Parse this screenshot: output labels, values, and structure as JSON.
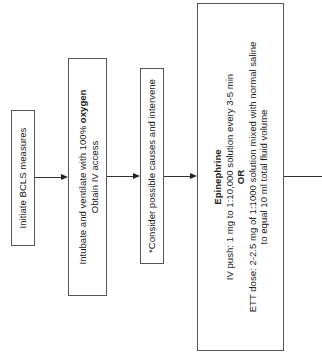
{
  "diagram": {
    "orientation": "rotated-90-ccw",
    "steps": [
      {
        "id": "bcls",
        "lines": [
          {
            "text": "Initiate BCLS measures"
          }
        ]
      },
      {
        "id": "intubate",
        "lines": [
          {
            "prefix": "Intubate and ventilate with 100% ",
            "bold": "oxygen"
          },
          {
            "text": "Obtain IV access"
          }
        ]
      },
      {
        "id": "causes",
        "lines": [
          {
            "text": "*Consider possible causes and intervene"
          }
        ]
      },
      {
        "id": "epinephrine",
        "title": "Epinephrine",
        "lines": [
          {
            "text": "IV push: 1 mg to 1:10,000 solution every 3-5 min"
          },
          {
            "bold": "OR"
          },
          {
            "text": "ETT dose: 2-2.5 mg of 1:1000 solution mixed with normal saline"
          },
          {
            "text": "to equal 10 ml total fluid volume"
          }
        ]
      }
    ],
    "connectors": [
      {
        "from": "bcls",
        "to": "intubate",
        "arrow": true
      },
      {
        "from": "intubate",
        "to": "causes",
        "arrow": true
      },
      {
        "from": "causes",
        "to": "epinephrine",
        "arrow": true
      },
      {
        "from": "epinephrine",
        "to": "next",
        "arrow": false
      }
    ],
    "colors": {
      "border": "#555555",
      "line": "#333333",
      "text": "#222222",
      "background": "#ffffff"
    }
  }
}
